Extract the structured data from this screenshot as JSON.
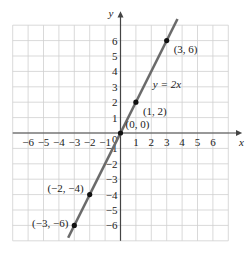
{
  "chart_data": {
    "type": "line",
    "title": "",
    "xlabel": "x",
    "ylabel": "y",
    "xlim": [
      -7,
      7
    ],
    "ylim": [
      -7,
      7
    ],
    "grid": true,
    "x_ticks": [
      -6,
      -5,
      -4,
      -3,
      -2,
      -1,
      1,
      2,
      3,
      4,
      5,
      6
    ],
    "y_ticks": [
      -6,
      -5,
      -4,
      -3,
      -2,
      -1,
      1,
      2,
      3,
      4,
      5,
      6
    ],
    "origin_label": "0",
    "series": [
      {
        "name": "y = 2x",
        "equation": "y = 2x",
        "color": "#6b6b6b",
        "line": {
          "x": [
            -3.4,
            3.7
          ],
          "y": [
            -6.8,
            7.4
          ]
        },
        "points": [
          {
            "x": -3,
            "y": -6,
            "label": "(−3, −6)"
          },
          {
            "x": -2,
            "y": -4,
            "label": "(−2, −4)"
          },
          {
            "x": 0,
            "y": 0,
            "label": "(0, 0)"
          },
          {
            "x": 1,
            "y": 2,
            "label": "(1, 2)"
          },
          {
            "x": 3,
            "y": 6,
            "label": "(3, 6)"
          }
        ]
      }
    ],
    "annotations": [
      {
        "text": "y = 2x",
        "x": 2.1,
        "y": 2.9
      }
    ],
    "colors": {
      "grid": "#cfcfcf",
      "axis": "#444444",
      "line": "#6b6b6b",
      "point": "#111111"
    }
  }
}
